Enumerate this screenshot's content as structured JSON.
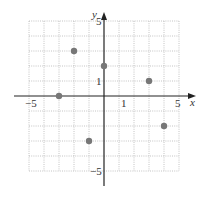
{
  "chart_data": {
    "type": "scatter",
    "title": "",
    "xlabel": "x",
    "ylabel": "y",
    "xlim": [
      -5,
      5
    ],
    "ylim": [
      -5,
      5
    ],
    "grid": true,
    "x_tick_labels": [
      {
        "value": -5,
        "label": "−5"
      },
      {
        "value": 1,
        "label": "1"
      },
      {
        "value": 5,
        "label": "5"
      }
    ],
    "y_tick_labels": [
      {
        "value": 5,
        "label": "5"
      },
      {
        "value": 1,
        "label": "1"
      },
      {
        "value": -5,
        "label": "−5"
      }
    ],
    "points": [
      {
        "x": -3,
        "y": 0
      },
      {
        "x": -2,
        "y": 3
      },
      {
        "x": 0,
        "y": 2
      },
      {
        "x": 3,
        "y": 1
      },
      {
        "x": 4,
        "y": -2
      },
      {
        "x": -1,
        "y": -3
      }
    ],
    "point_color": "#777777"
  }
}
